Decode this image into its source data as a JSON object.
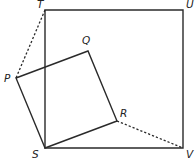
{
  "diagram": {
    "type": "geometry",
    "points": {
      "T": {
        "label": "T",
        "x": 45,
        "y": 10,
        "lx": 37,
        "ly": 8
      },
      "U": {
        "label": "U",
        "x": 183,
        "y": 10,
        "lx": 186,
        "ly": 8
      },
      "V": {
        "label": "V",
        "x": 183,
        "y": 148,
        "lx": 186,
        "ly": 158
      },
      "S": {
        "label": "S",
        "x": 45,
        "y": 148,
        "lx": 32,
        "ly": 158
      },
      "P": {
        "label": "P",
        "x": 16,
        "y": 78,
        "lx": 4,
        "ly": 82
      },
      "Q": {
        "label": "Q",
        "x": 88,
        "y": 51,
        "lx": 82,
        "ly": 44
      },
      "R": {
        "label": "R",
        "x": 117,
        "y": 121,
        "lx": 120,
        "ly": 117
      }
    },
    "shapes": [
      {
        "name": "square-STUV",
        "vertices": [
          "S",
          "T",
          "U",
          "V"
        ],
        "style": "solid"
      },
      {
        "name": "square-SPQR",
        "vertices": [
          "S",
          "P",
          "Q",
          "R"
        ],
        "style": "solid"
      }
    ],
    "segments": [
      {
        "name": "segment-TP",
        "from": "T",
        "to": "P",
        "style": "dashed"
      },
      {
        "name": "segment-RV",
        "from": "R",
        "to": "V",
        "style": "dashed"
      }
    ]
  }
}
